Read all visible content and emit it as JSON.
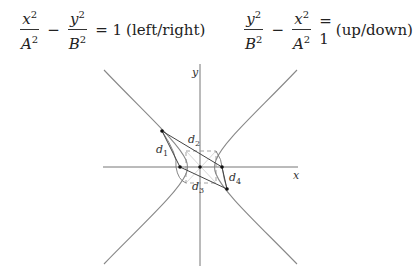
{
  "equations": {
    "left": {
      "num1": "x",
      "den1": "A",
      "num2": "y",
      "den2": "B",
      "exp": "2",
      "minus": "−",
      "equals": "= 1",
      "label": "(left/right)"
    },
    "right": {
      "num1": "y",
      "den1": "B",
      "num2": "x",
      "den2": "A",
      "exp": "2",
      "minus": "−",
      "equals": "= 1",
      "label": "(up/down)"
    }
  },
  "diagram": {
    "axis_labels": {
      "x": "x",
      "y": "y"
    },
    "distance_labels": [
      {
        "main": "d",
        "sub": "1"
      },
      {
        "main": "d",
        "sub": "2"
      },
      {
        "main": "d",
        "sub": "3"
      },
      {
        "main": "d",
        "sub": "4"
      }
    ],
    "colors": {
      "curve": "#888888",
      "axis": "#777777",
      "segment": "#444444",
      "dashed": "#999999",
      "point": "#111111"
    }
  }
}
